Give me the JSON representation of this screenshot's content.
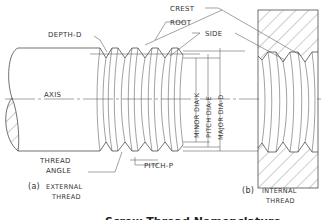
{
  "figure": {
    "caption": "Screw Thread Nomenclature",
    "external": {
      "prefix": "(a)",
      "line1": "EXTERNAL",
      "line2": "THREAD"
    },
    "internal": {
      "prefix": "(b)",
      "line1": "INTERNAL",
      "line2": "THREAD"
    }
  },
  "labels": {
    "depth": "DEPTH-D",
    "crest": "CREST",
    "root": "ROOT",
    "side": "SIDE",
    "axis": "AXIS",
    "thread_angle_1": "THREAD",
    "thread_angle_2": "ANGLE",
    "pitch": "PITCH-P",
    "minor_dia": "MINOR DIA-K",
    "pitch_dia": "PITCH DIA-E",
    "major_dia": "MAJOR DIA-D"
  },
  "colors": {
    "line": "#333333",
    "background": "#ffffff"
  }
}
